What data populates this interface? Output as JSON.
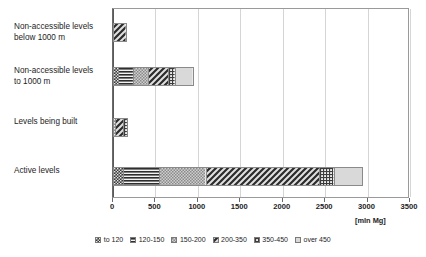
{
  "chart_data": {
    "type": "bar",
    "orientation": "horizontal",
    "stacked": true,
    "title": "",
    "xlabel": "[mln Mg]",
    "ylabel": "",
    "xlim": [
      0,
      3500
    ],
    "xticks": [
      0,
      500,
      1000,
      1500,
      2000,
      2500,
      3000,
      3500
    ],
    "xtick_labels": [
      "0",
      "500",
      "1000",
      "1500",
      "2000",
      "2500",
      "3000",
      "3500"
    ],
    "grid": true,
    "legend_position": "bottom",
    "categories": [
      "Non-accessible levels\nbelow 1000 m",
      "Non-accessible levels\nto 1000 m",
      "Levels being built",
      "Active levels"
    ],
    "series": [
      {
        "name": "to 120",
        "values": [
          0,
          60,
          20,
          120
        ]
      },
      {
        "name": "120-150",
        "values": [
          0,
          180,
          0,
          430
        ]
      },
      {
        "name": "150-200",
        "values": [
          0,
          180,
          0,
          550
        ]
      },
      {
        "name": "200-350",
        "values": [
          160,
          250,
          120,
          1350
        ]
      },
      {
        "name": "350-450",
        "values": [
          0,
          80,
          40,
          170
        ]
      },
      {
        "name": "over  450",
        "values": [
          0,
          200,
          0,
          330
        ]
      }
    ],
    "totals": [
      160,
      950,
      180,
      2950
    ]
  },
  "legend": {
    "items": [
      {
        "label": "to 120",
        "pattern": "dense-dots-dark"
      },
      {
        "label": "120-150",
        "pattern": "horizontal-lines"
      },
      {
        "label": "150-200",
        "pattern": "light-checker"
      },
      {
        "label": "200-350",
        "pattern": "dark-diagonal"
      },
      {
        "label": "350-450",
        "pattern": "fine-grid"
      },
      {
        "label": "over  450",
        "pattern": "solid-light-gray"
      }
    ]
  },
  "axis": {
    "unit_label": "[mln Mg]"
  },
  "colors": {
    "background": "#ffffff",
    "plot_border": "#9a9a9a",
    "gridline": "#d5d5d5",
    "bar_outline": "#8a8a8a",
    "text": "#1d1d1d",
    "light_gray_fill": "#d9d9d9"
  }
}
